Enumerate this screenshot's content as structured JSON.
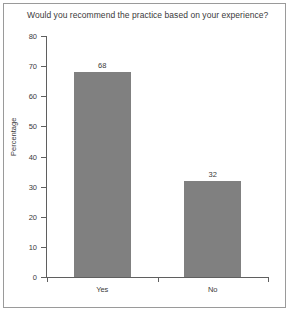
{
  "figure": {
    "title": "Would you recommend the practice based on your experience?",
    "border_color": "#9a9a9a",
    "background": "#ffffff"
  },
  "chart_data": {
    "type": "bar",
    "title": "Would you recommend the practice based on your experience?",
    "categories": [
      "Yes",
      "No"
    ],
    "values": [
      68,
      32
    ],
    "value_labels": [
      "68",
      "32"
    ],
    "xlabel": "",
    "ylabel": "Percentage",
    "ylim": [
      0,
      80
    ],
    "ytick_labels": [
      "0",
      "10",
      "20",
      "30",
      "40",
      "50",
      "60",
      "70",
      "80"
    ],
    "ytick_values": [
      0,
      10,
      20,
      30,
      40,
      50,
      60,
      70,
      80
    ],
    "grid": false,
    "legend": false,
    "bar_color": "#808080",
    "axis_color": "#5f5f5f",
    "text_color": "#3a3a3a"
  }
}
